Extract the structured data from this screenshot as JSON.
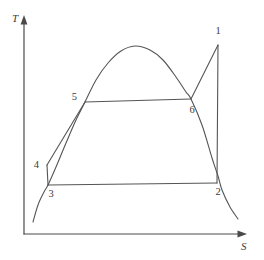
{
  "figure": {
    "axes": {
      "y_label": "T",
      "x_label": "S",
      "y_axis_name": "temperature-axis",
      "x_axis_name": "entropy-axis"
    },
    "colors": {
      "stroke": "#555555",
      "axis": "#4a4a4a",
      "text": "#3c3c3c",
      "background": "#ffffff"
    }
  },
  "chart_data": {
    "type": "line",
    "xlabel": "S",
    "ylabel": "T",
    "grid": false,
    "legend": null,
    "axis_origin_px": [
      24,
      234
    ],
    "saturation_dome": {
      "name": "saturation-dome-curve",
      "points_px": [
        [
          33,
          222
        ],
        [
          38,
          205
        ],
        [
          44,
          192
        ],
        [
          48,
          185
        ],
        [
          56,
          167
        ],
        [
          66,
          143
        ],
        [
          76,
          120
        ],
        [
          85,
          102
        ],
        [
          96,
          80
        ],
        [
          108,
          63
        ],
        [
          121,
          51
        ],
        [
          135,
          46
        ],
        [
          150,
          50
        ],
        [
          163,
          60
        ],
        [
          176,
          77
        ],
        [
          186,
          92
        ],
        [
          191,
          99
        ],
        [
          202,
          125
        ],
        [
          212,
          158
        ],
        [
          218,
          176
        ],
        [
          222,
          190
        ],
        [
          230,
          207
        ],
        [
          238,
          219
        ]
      ]
    },
    "cycle_points": [
      {
        "id": "1",
        "label": "1",
        "x_px": 218,
        "y_px": 45,
        "label_x_px": 218,
        "label_y_px": 34,
        "label_anchor": "middle"
      },
      {
        "id": "2",
        "label": "2",
        "x_px": 217,
        "y_px": 183,
        "label_x_px": 218,
        "label_y_px": 195,
        "label_anchor": "middle"
      },
      {
        "id": "3",
        "label": "3",
        "x_px": 48,
        "y_px": 185,
        "label_x_px": 51,
        "label_y_px": 197,
        "label_anchor": "middle"
      },
      {
        "id": "4",
        "label": "4",
        "x_px": 47,
        "y_px": 165,
        "label_x_px": 39,
        "label_y_px": 168,
        "label_anchor": "end"
      },
      {
        "id": "5",
        "label": "5",
        "x_px": 85,
        "y_px": 102,
        "label_x_px": 77,
        "label_y_px": 100,
        "label_anchor": "end"
      },
      {
        "id": "6",
        "label": "6",
        "x_px": 191,
        "y_px": 99,
        "label_x_px": 192,
        "label_y_px": 113,
        "label_anchor": "middle"
      }
    ],
    "cycle_segments": [
      {
        "name": "segment-1-2",
        "from": "1",
        "to": "2",
        "path_px": "M 218 45 L 217 183"
      },
      {
        "name": "segment-6-1",
        "from": "6",
        "to": "1",
        "path_px": "M 191 99 L 218 45"
      },
      {
        "name": "segment-5-6",
        "from": "5",
        "to": "6",
        "path_px": "M 85 102 L 191 99"
      },
      {
        "name": "segment-4-5",
        "from": "4",
        "to": "5",
        "path_px": "M 47 165 L 85 102"
      },
      {
        "name": "segment-3-4",
        "from": "3",
        "to": "4",
        "path_px": "M 48 185 L 47 165"
      },
      {
        "name": "segment-3-2",
        "from": "3",
        "to": "2",
        "path_px": "M 48 185 L 217 183"
      }
    ]
  }
}
